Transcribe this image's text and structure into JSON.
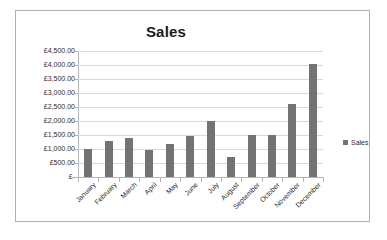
{
  "chart_data": {
    "type": "bar",
    "title": "Sales",
    "xlabel": "",
    "ylabel": "",
    "categories": [
      "January",
      "February",
      "March",
      "April",
      "May",
      "June",
      "July",
      "August",
      "September",
      "October",
      "November",
      "December"
    ],
    "values": [
      1000,
      1280,
      1390,
      960,
      1180,
      1450,
      2010,
      720,
      1510,
      1510,
      2610,
      4030
    ],
    "series": [
      {
        "name": "Sales",
        "color": "#737373",
        "values": [
          1000,
          1280,
          1390,
          960,
          1180,
          1450,
          2010,
          720,
          1510,
          1510,
          2610,
          4030
        ]
      }
    ],
    "ylim": [
      0,
      4500
    ],
    "ytick_values": [
      0,
      500,
      1000,
      1500,
      2000,
      2500,
      3000,
      3500,
      4000,
      4500
    ],
    "ytick_labels": [
      "£-",
      "£500.00",
      "£1,000.00",
      "£1,500.00",
      "£2,000.00",
      "£2,500.00",
      "£3,000.00",
      "£3,500.00",
      "£4,000.00",
      "£4,500.00"
    ],
    "grid": true,
    "legend": {
      "position": "right",
      "entries": [
        "Sales"
      ]
    },
    "currency_symbol": "£",
    "plot_background": "#ffffff",
    "gridline_color": "#d9d9d9",
    "axis_color": "#b5b5b5",
    "frame_color": "#b0b0b0"
  }
}
